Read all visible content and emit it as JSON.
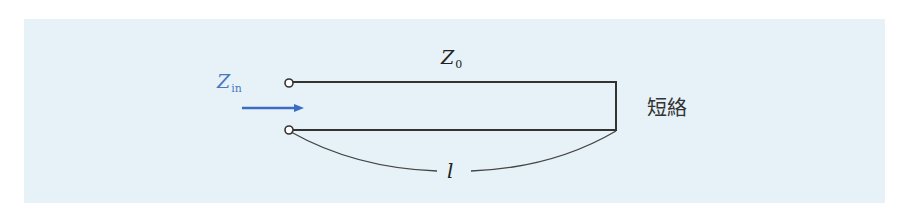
{
  "diagram": {
    "colors": {
      "background": "#ffffff",
      "panel": "#e6f2f8",
      "line": "#333333",
      "accent_blue": "#3a6cc4",
      "zin_text": "#4a78c0"
    },
    "labels": {
      "characteristic_impedance": {
        "main": "Z",
        "sub": "0"
      },
      "input_impedance": {
        "main": "Z",
        "sub": "in"
      },
      "length": "l",
      "termination": "短絡"
    },
    "elements": {
      "upper_terminal": {
        "cx": 289,
        "cy": 83,
        "r": 4
      },
      "lower_terminal": {
        "cx": 289,
        "cy": 130,
        "r": 4
      },
      "upper_line": {
        "x1": 293,
        "y1": 82,
        "x2": 616,
        "y2": 82
      },
      "lower_line": {
        "x1": 293,
        "y1": 130,
        "x2": 616,
        "y2": 130
      },
      "short_circuit": {
        "x": 616,
        "y1": 82,
        "y2": 130
      },
      "input_arrow": {
        "x1": 242,
        "x2": 303,
        "y": 108
      },
      "length_brace": {
        "left_start": [
          291,
          132
        ],
        "left_end": [
          437,
          171
        ],
        "right_start": [
          471,
          171
        ],
        "right_end": [
          616,
          131
        ]
      }
    }
  }
}
